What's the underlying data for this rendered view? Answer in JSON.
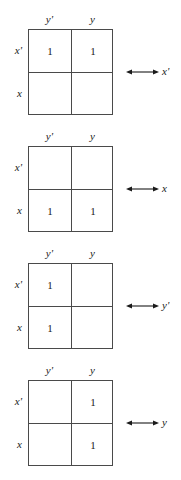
{
  "figure": {
    "kind": "karnaugh-map-variable-regions",
    "map_count": 4,
    "line_color": "#4a4a4a",
    "text_color": "#1a1a1a",
    "background": "#ffffff"
  },
  "maps": [
    {
      "col_headers": [
        "y'",
        "y"
      ],
      "row_labels": [
        "x'",
        "x"
      ],
      "cells": {
        "top_left": "1",
        "top_right": "1",
        "bottom_left": "",
        "bottom_right": ""
      },
      "arrow": {
        "label": "x'",
        "style": "double-headed"
      }
    },
    {
      "col_headers": [
        "y'",
        "y"
      ],
      "row_labels": [
        "x'",
        "x"
      ],
      "cells": {
        "top_left": "",
        "top_right": "",
        "bottom_left": "1",
        "bottom_right": "1"
      },
      "arrow": {
        "label": "x",
        "style": "double-headed"
      }
    },
    {
      "col_headers": [
        "y'",
        "y"
      ],
      "row_labels": [
        "x'",
        "x"
      ],
      "cells": {
        "top_left": "1",
        "top_right": "",
        "bottom_left": "1",
        "bottom_right": ""
      },
      "arrow": {
        "label": "y'",
        "style": "double-headed"
      }
    },
    {
      "col_headers": [
        "y'",
        "y"
      ],
      "row_labels": [
        "x'",
        "x"
      ],
      "cells": {
        "top_left": "",
        "top_right": "1",
        "bottom_left": "",
        "bottom_right": "1"
      },
      "arrow": {
        "label": "y",
        "style": "double-headed"
      }
    }
  ]
}
